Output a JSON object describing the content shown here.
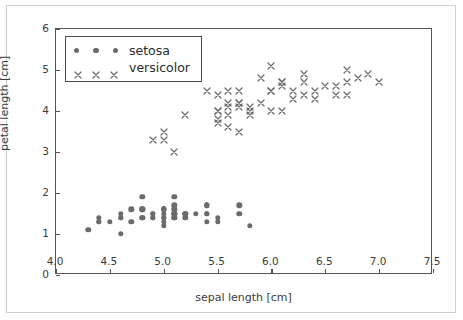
{
  "figure": {
    "background_color": "#ffffff",
    "frame_color": "#cfcfcf",
    "axes_color": "#555555",
    "marker_color": "#6b6b6b"
  },
  "legend": {
    "entries": [
      {
        "label": "setosa",
        "marker": "circle-marker",
        "marker_count": 3
      },
      {
        "label": "versicolor",
        "marker": "x-marker",
        "marker_count": 3
      }
    ],
    "position": "upper left",
    "frame": true
  },
  "chart_data": {
    "type": "scatter",
    "title": "",
    "xlabel": "sepal length [cm]",
    "ylabel": "petal length [cm]",
    "xlim": [
      4.0,
      7.5
    ],
    "ylim": [
      0,
      6
    ],
    "xticks": [
      4.0,
      4.5,
      5.0,
      5.5,
      6.0,
      6.5,
      7.0,
      7.5
    ],
    "xticklabels": [
      "4.0",
      "4.5",
      "5.0",
      "5.5",
      "6.0",
      "6.5",
      "7.0",
      "7.5"
    ],
    "yticks": [
      0,
      1,
      2,
      3,
      4,
      5,
      6
    ],
    "yticklabels": [
      "0",
      "1",
      "2",
      "3",
      "4",
      "5",
      "6"
    ],
    "grid": false,
    "legend_position": "upper left",
    "series": [
      {
        "name": "setosa",
        "marker": "o",
        "color": "#6b6b6b",
        "x": [
          5.1,
          4.9,
          4.7,
          4.6,
          5.0,
          5.4,
          4.6,
          5.0,
          4.4,
          4.9,
          5.4,
          4.8,
          4.8,
          4.3,
          5.8,
          5.7,
          5.4,
          5.1,
          5.7,
          5.1,
          5.4,
          5.1,
          4.6,
          5.1,
          4.8,
          5.0,
          5.0,
          5.2,
          5.2,
          4.7,
          4.8,
          5.4,
          5.2,
          5.5,
          4.9,
          5.0,
          5.5,
          4.9,
          4.4,
          5.1,
          5.0,
          4.5,
          4.4,
          5.0,
          5.1,
          4.8,
          5.1,
          4.6,
          5.3,
          5.0
        ],
        "y": [
          1.4,
          1.4,
          1.3,
          1.5,
          1.4,
          1.7,
          1.4,
          1.5,
          1.4,
          1.5,
          1.5,
          1.6,
          1.4,
          1.1,
          1.2,
          1.5,
          1.3,
          1.4,
          1.7,
          1.5,
          1.7,
          1.5,
          1.0,
          1.7,
          1.9,
          1.6,
          1.6,
          1.5,
          1.4,
          1.6,
          1.6,
          1.5,
          1.5,
          1.4,
          1.5,
          1.2,
          1.3,
          1.4,
          1.3,
          1.5,
          1.3,
          1.3,
          1.3,
          1.6,
          1.9,
          1.4,
          1.6,
          1.4,
          1.5,
          1.4
        ]
      },
      {
        "name": "versicolor",
        "marker": "x",
        "color": "#6b6b6b",
        "x": [
          7.0,
          6.4,
          6.9,
          5.5,
          6.5,
          5.7,
          6.3,
          4.9,
          6.6,
          5.2,
          5.0,
          5.9,
          6.0,
          6.1,
          5.6,
          6.7,
          5.6,
          5.8,
          6.2,
          5.6,
          5.9,
          6.1,
          6.3,
          6.1,
          6.4,
          6.6,
          6.8,
          6.7,
          6.0,
          5.7,
          5.5,
          5.5,
          5.8,
          6.0,
          5.4,
          6.0,
          6.7,
          6.3,
          5.6,
          5.5,
          5.5,
          6.1,
          5.8,
          5.0,
          5.6,
          5.7,
          5.7,
          6.2,
          5.1,
          5.7
        ],
        "y": [
          4.7,
          4.5,
          4.9,
          4.0,
          4.6,
          4.5,
          4.7,
          3.3,
          4.6,
          3.9,
          3.5,
          4.2,
          4.0,
          4.7,
          3.6,
          4.4,
          4.5,
          4.1,
          4.5,
          3.9,
          4.8,
          4.0,
          4.9,
          4.7,
          4.3,
          4.4,
          4.8,
          5.0,
          4.5,
          3.5,
          3.8,
          3.7,
          3.9,
          5.1,
          4.5,
          4.5,
          4.7,
          4.4,
          4.1,
          4.0,
          4.4,
          4.6,
          4.0,
          3.3,
          4.2,
          4.2,
          4.2,
          4.3,
          3.0,
          4.1
        ]
      }
    ]
  }
}
